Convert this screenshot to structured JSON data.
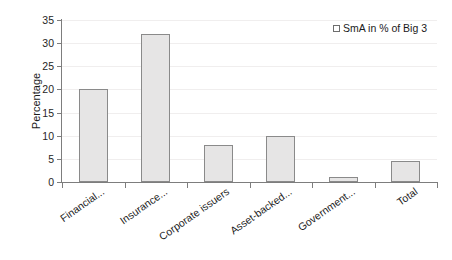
{
  "chart_data": {
    "type": "bar",
    "title": "",
    "xlabel": "",
    "ylabel": "Percentage",
    "ylim": [
      0,
      35
    ],
    "yticks": [
      0,
      5,
      10,
      15,
      20,
      25,
      30,
      35
    ],
    "grid": true,
    "legend_position": "top-right",
    "categories": [
      "Financial...",
      "Insurance...",
      "Corporate issuers",
      "Asset-backed...",
      "Government...",
      "Total"
    ],
    "series": [
      {
        "name": "SmA in % of Big 3",
        "values": [
          20,
          32,
          8,
          10,
          1,
          4.5
        ]
      }
    ],
    "colors": {
      "bar_fill": "#e6e5e5",
      "bar_border": "#8a8a8a",
      "axis": "#7d7d7d",
      "grid": "#f0eeee",
      "text": "#1a1a1a"
    }
  },
  "legend": {
    "entries": [
      {
        "label": "SmA in % of Big 3"
      }
    ]
  }
}
